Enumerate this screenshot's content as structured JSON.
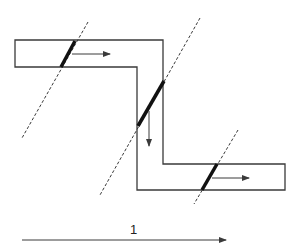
{
  "diagram": {
    "type": "stepped-channel-with-wavefronts",
    "stroke_color": "#3a3a3a",
    "channel_path": [
      [
        15,
        40
      ],
      [
        163,
        40
      ],
      [
        163,
        164
      ],
      [
        285,
        164
      ],
      [
        285,
        190
      ],
      [
        137,
        190
      ],
      [
        137,
        67
      ],
      [
        15,
        67
      ]
    ],
    "wavefronts": [
      {
        "dashed": [
          [
            88,
            22
          ],
          [
            22,
            138
          ]
        ],
        "thick": [
          [
            75,
            41
          ],
          [
            61,
            67
          ]
        ],
        "arrow": {
          "from": [
            72,
            54
          ],
          "to": [
            110,
            54
          ]
        }
      },
      {
        "dashed": [
          [
            200,
            18
          ],
          [
            100,
            195
          ]
        ],
        "thick": [
          [
            164,
            81
          ],
          [
            138,
            126
          ]
        ],
        "arrow": {
          "from": [
            149,
            111
          ],
          "to": [
            149,
            146
          ]
        }
      },
      {
        "dashed": [
          [
            238,
            130
          ],
          [
            194,
            204
          ]
        ],
        "thick": [
          [
            217,
            164
          ],
          [
            202,
            190
          ]
        ],
        "arrow": {
          "from": [
            212,
            178
          ],
          "to": [
            249,
            178
          ]
        }
      }
    ],
    "bottom_arrow": {
      "from": [
        22,
        240
      ],
      "to": [
        226,
        240
      ],
      "label": "1"
    }
  }
}
